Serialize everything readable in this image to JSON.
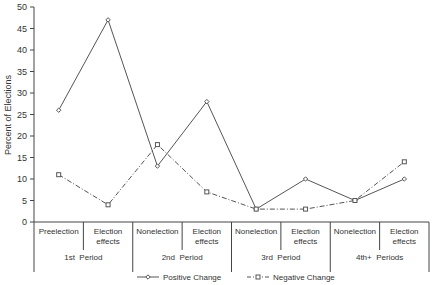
{
  "chart_data": {
    "type": "line",
    "title": "",
    "xlabel": "",
    "ylabel": "Percent of Elections",
    "ylim": [
      0,
      50
    ],
    "yticks": [
      0,
      5,
      10,
      15,
      20,
      25,
      30,
      35,
      40,
      45,
      50
    ],
    "grid": false,
    "categories": [
      "Preelection",
      "Election effects",
      "Nonelection",
      "Election effects",
      "Nonelection",
      "Election effects",
      "Nonelection",
      "Election effects"
    ],
    "category_lines": [
      [
        "Preelection"
      ],
      [
        "Election",
        "effects"
      ],
      [
        "Nonelection"
      ],
      [
        "Election",
        "effects"
      ],
      [
        "Nonelection"
      ],
      [
        "Election",
        "effects"
      ],
      [
        "Nonelection"
      ],
      [
        "Election",
        "effects"
      ]
    ],
    "groups": [
      {
        "label": "1st  Period",
        "span": 2
      },
      {
        "label": "2nd  Period",
        "span": 2
      },
      {
        "label": "3rd  Period",
        "span": 2
      },
      {
        "label": "4th+  Periods",
        "span": 2
      }
    ],
    "series": [
      {
        "name": "Positive Change",
        "style": "solid",
        "marker": "diamond",
        "values": [
          26,
          47,
          13,
          28,
          3,
          10,
          5,
          10
        ]
      },
      {
        "name": "Negative Change",
        "style": "dash-dot",
        "marker": "square",
        "values": [
          11,
          4,
          18,
          7,
          3,
          3,
          5,
          14
        ]
      }
    ],
    "legend_position": "bottom-center",
    "colors": {
      "line": "#555555",
      "axis": "#444444",
      "text": "#333333"
    }
  }
}
